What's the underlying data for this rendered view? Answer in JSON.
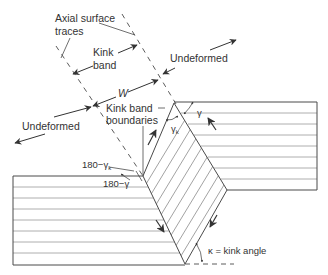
{
  "figure": {
    "colors": {
      "line": "#4a4a4a",
      "bedding": "#9a9a9a",
      "text": "#333333",
      "background": "#ffffff"
    }
  },
  "labels": {
    "axial_surface_traces_line1": "Axial surface",
    "axial_surface_traces_line2": "traces",
    "kink_band_line1": "Kink",
    "kink_band_line2": "band",
    "width": "W",
    "undeformed_left": "Undeformed",
    "undeformed_right": "Undeformed",
    "kink_band_boundaries_line1": "Kink band",
    "kink_band_boundaries_line2": "boundaries",
    "gamma": "γ",
    "gamma_k": "γ",
    "gamma_k_sub": "k",
    "angle_180_minus_gamma_k": "180−γ",
    "angle_180_minus_gamma_k_sub": "k",
    "angle_180_minus_gamma": "180−γ",
    "kink_angle": "κ = kink angle"
  }
}
